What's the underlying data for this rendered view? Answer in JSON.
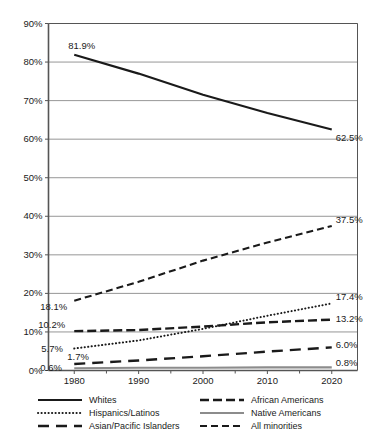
{
  "chart_data": {
    "type": "line",
    "title": "",
    "subtitle": "",
    "xlabel": "",
    "ylabel": "",
    "x": [
      1980,
      1990,
      2000,
      2010,
      2020
    ],
    "xlim": [
      1976,
      2024
    ],
    "ylim": [
      0,
      90
    ],
    "y_ticks": [
      "0%",
      "10%",
      "20%",
      "30%",
      "40%",
      "50%",
      "60%",
      "70%",
      "80%",
      "90%"
    ],
    "y_tick_values": [
      0,
      10,
      20,
      30,
      40,
      50,
      60,
      70,
      80,
      90
    ],
    "x_ticks": [
      "1980",
      "1990",
      "2000",
      "2010",
      "2020"
    ],
    "grid": "horizontal",
    "legend_position": "bottom",
    "series": [
      {
        "name": "Whites",
        "style": "solid",
        "color": "#1a1a1a",
        "values": [
          81.9,
          77.0,
          71.5,
          66.8,
          62.5
        ],
        "label_start": "81.9%",
        "label_end": "62.5%"
      },
      {
        "name": "All minorities",
        "style": "dashed",
        "color": "#1a1a1a",
        "values": [
          18.1,
          23.0,
          28.5,
          33.2,
          37.5
        ],
        "label_start": "18.1%",
        "label_end": "37.5%"
      },
      {
        "name": "African Americans",
        "style": "long-dash",
        "color": "#1a1a1a",
        "values": [
          10.2,
          10.5,
          11.4,
          12.5,
          13.2
        ],
        "label_start": "10.2%",
        "label_end": "13.2%"
      },
      {
        "name": "Hispanics/Latinos",
        "style": "dotted",
        "color": "#1a1a1a",
        "values": [
          5.7,
          7.8,
          10.8,
          14.2,
          17.4
        ],
        "label_start": "5.7%",
        "label_end": "17.4%"
      },
      {
        "name": "Asian/Pacific Islanders",
        "style": "dash-gap",
        "color": "#1a1a1a",
        "values": [
          1.7,
          2.6,
          3.7,
          4.9,
          6.0
        ],
        "label_start": "1.7%",
        "label_end": "6.0%"
      },
      {
        "name": "Native Americans",
        "style": "solid-gray",
        "color": "#8c8c8c",
        "values": [
          0.6,
          0.7,
          0.7,
          0.8,
          0.8
        ],
        "label_start": "0.6%",
        "label_end": "0.8%"
      }
    ],
    "legend": [
      {
        "label": "Whites",
        "style": "solid",
        "color": "#1a1a1a"
      },
      {
        "label": "African Americans",
        "style": "long-dash",
        "color": "#1a1a1a"
      },
      {
        "label": "Hispanics/Latinos",
        "style": "dotted",
        "color": "#1a1a1a"
      },
      {
        "label": "Native Americans",
        "style": "solid-gray",
        "color": "#8c8c8c"
      },
      {
        "label": "Asian/Pacific Islanders",
        "style": "dash-gap",
        "color": "#1a1a1a"
      },
      {
        "label": "All minorities",
        "style": "dashed",
        "color": "#1a1a1a"
      }
    ]
  },
  "axis": {
    "axis_color": "#555555",
    "grid_color": "#8a8a8a"
  }
}
